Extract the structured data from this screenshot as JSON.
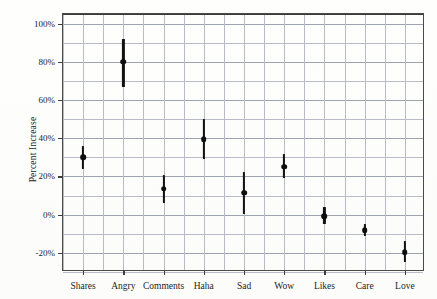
{
  "chart_data": {
    "type": "scatter",
    "title": "",
    "xlabel": "",
    "ylabel": "Percent Increase",
    "ylim": [
      -30,
      105
    ],
    "ytick_labels": [
      "100%",
      "80%",
      "60%",
      "40%",
      "20%",
      "0%",
      "-20%"
    ],
    "ytick_values": [
      100,
      80,
      60,
      40,
      20,
      0,
      -20
    ],
    "gridline_step": 10,
    "grid": true,
    "legend": "none",
    "zero_reference_line": 0,
    "categories": [
      "Shares",
      "Angry",
      "Comments",
      "Haha",
      "Sad",
      "Wow",
      "Likes",
      "Care",
      "Love"
    ],
    "values": [
      30,
      80,
      13.5,
      39.5,
      11.5,
      25,
      -0.8,
      -8,
      -19.5
    ],
    "error_low": [
      24,
      67,
      6,
      29,
      0.5,
      19,
      -5,
      -11,
      -25
    ],
    "error_high": [
      36,
      92,
      21,
      50,
      22.5,
      31.5,
      4,
      -5,
      -14
    ],
    "series": [
      {
        "name": "Percent Increase",
        "points": [
          {
            "category": "Shares",
            "value": 30,
            "low": 24,
            "high": 36
          },
          {
            "category": "Angry",
            "value": 80,
            "low": 67,
            "high": 92
          },
          {
            "category": "Comments",
            "value": 13.5,
            "low": 6,
            "high": 21
          },
          {
            "category": "Haha",
            "value": 39.5,
            "low": 29,
            "high": 50
          },
          {
            "category": "Sad",
            "value": 11.5,
            "low": 0.5,
            "high": 22.5
          },
          {
            "category": "Wow",
            "value": 25,
            "low": 19,
            "high": 31.5
          },
          {
            "category": "Likes",
            "value": -0.8,
            "low": -5,
            "high": 4
          },
          {
            "category": "Care",
            "value": -8,
            "low": -11,
            "high": -5
          },
          {
            "category": "Love",
            "value": -19.5,
            "low": -25,
            "high": -14
          }
        ]
      }
    ],
    "colors": {
      "marker": "#0d0d0d",
      "errorbar": "#111111",
      "gridline": "#b9bcc6",
      "frame": "#4a4a4a",
      "zeroline": "#3a3a3a",
      "text": "#1c1c1c",
      "background": "#fefefd"
    }
  }
}
